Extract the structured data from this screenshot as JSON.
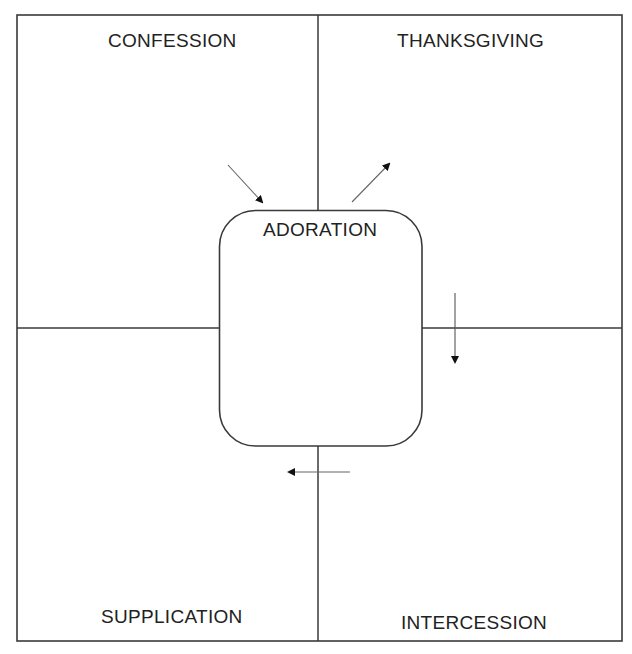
{
  "diagram": {
    "center": {
      "label": "ADORATION"
    },
    "quadrants": [
      {
        "id": "top-left",
        "label": "CONFESSION"
      },
      {
        "id": "top-right",
        "label": "THANKSGIVING"
      },
      {
        "id": "bottom-left",
        "label": "SUPPLICATION"
      },
      {
        "id": "bottom-right",
        "label": "INTERCESSION"
      }
    ],
    "arrows": [
      {
        "from": "CONFESSION",
        "to": "ADORATION",
        "direction": "down-right"
      },
      {
        "from": "ADORATION",
        "to": "THANKSGIVING",
        "direction": "up-right"
      },
      {
        "from": "THANKSGIVING",
        "to": "INTERCESSION",
        "direction": "down"
      },
      {
        "from": "INTERCESSION",
        "to": "SUPPLICATION",
        "direction": "left"
      }
    ],
    "colors": {
      "line": "#3a3a3a",
      "arrow": "#555555",
      "text": "#222222",
      "background": "#ffffff"
    }
  }
}
